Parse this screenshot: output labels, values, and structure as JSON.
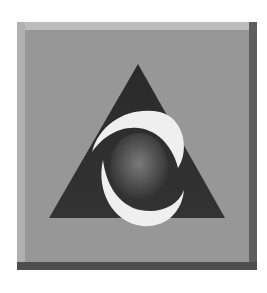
{
  "icon": {
    "name": "aol-logo",
    "description": "Triangle with swoosh around a sphere on a beveled square button",
    "colors": {
      "face": "#979797",
      "triangle": "#2e2e2e",
      "swoosh": "#f0f0f0",
      "sphere": "#555555"
    }
  }
}
